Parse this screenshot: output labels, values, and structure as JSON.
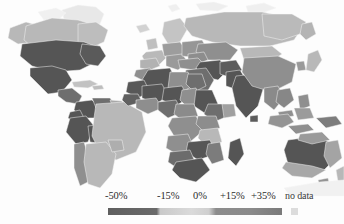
{
  "figure": {
    "type": "choropleth-world-map",
    "title": "",
    "background_color": "#fdfdfd"
  },
  "legend": {
    "orientation": "horizontal",
    "bar_start_x": 108,
    "bar_end_x": 282,
    "ticks": [
      {
        "label": "-50%",
        "x": 108,
        "value": -50
      },
      {
        "label": "-15%",
        "x": 159,
        "value": -15
      },
      {
        "label": "0%",
        "x": 194,
        "value": 0
      },
      {
        "label": "+15%",
        "x": 222,
        "value": 15
      },
      {
        "label": "+35%",
        "x": 253,
        "value": 35
      }
    ],
    "nodata": {
      "label": "no data",
      "x": 303,
      "swatch_color": "#dcdcdc"
    },
    "gradient_stops": [
      {
        "offset": "0%",
        "color": "#5f5f5f"
      },
      {
        "offset": "28%",
        "color": "#6a6a6a"
      },
      {
        "offset": "30%",
        "color": "#c9c9c9"
      },
      {
        "offset": "48%",
        "color": "#dadada"
      },
      {
        "offset": "58%",
        "color": "#cfcfcf"
      },
      {
        "offset": "62%",
        "color": "#8c8c8c"
      },
      {
        "offset": "82%",
        "color": "#8a8a8a"
      },
      {
        "offset": "100%",
        "color": "#7a7a7a"
      }
    ]
  },
  "chart_data": {
    "type": "heatmap",
    "title": "",
    "xlabel": "",
    "ylabel": "",
    "subtype": "world choropleth map",
    "colorbar_label": "",
    "colorbar_ticks": [
      "-50%",
      "-15%",
      "0%",
      "+15%",
      "+35%"
    ],
    "colorbar_range": [
      -50,
      35
    ],
    "nodata_label": "no data",
    "grid": false,
    "legend_position": "bottom",
    "palette": {
      "very_dark": "#555555",
      "dark": "#6e6e6e",
      "medium": "#8f8f8f",
      "light": "#b8b8b8",
      "very_light": "#d6d6d6",
      "no_data": "#e8e8e8",
      "ocean": "#fdfdfd",
      "border": "#f3f3f3"
    },
    "regions": [
      {
        "name": "Alaska",
        "shade": "light",
        "value": -10
      },
      {
        "name": "Canada",
        "shade": "light",
        "value": -10
      },
      {
        "name": "Greenland",
        "shade": "no_data",
        "value": null
      },
      {
        "name": "United States",
        "shade": "very_dark",
        "value": -45
      },
      {
        "name": "Mexico",
        "shade": "very_dark",
        "value": -45
      },
      {
        "name": "Central America",
        "shade": "dark",
        "value": -30
      },
      {
        "name": "Caribbean",
        "shade": "light",
        "value": -8
      },
      {
        "name": "Colombia",
        "shade": "very_dark",
        "value": -42
      },
      {
        "name": "Venezuela",
        "shade": "dark",
        "value": -28
      },
      {
        "name": "Peru",
        "shade": "very_dark",
        "value": -44
      },
      {
        "name": "Bolivia",
        "shade": "very_dark",
        "value": -44
      },
      {
        "name": "Brazil",
        "shade": "light",
        "value": -6
      },
      {
        "name": "Chile",
        "shade": "medium",
        "value": -18
      },
      {
        "name": "Argentina",
        "shade": "light",
        "value": -6
      },
      {
        "name": "Western Europe",
        "shade": "light",
        "value": -8
      },
      {
        "name": "Eastern Europe",
        "shade": "medium",
        "value": -16
      },
      {
        "name": "Russia",
        "shade": "light",
        "value": -5
      },
      {
        "name": "Kazakhstan",
        "shade": "medium",
        "value": -18
      },
      {
        "name": "Mongolia",
        "shade": "light",
        "value": -7
      },
      {
        "name": "China",
        "shade": "medium",
        "value": -20
      },
      {
        "name": "India",
        "shade": "very_dark",
        "value": -46
      },
      {
        "name": "Pakistan",
        "shade": "very_dark",
        "value": -45
      },
      {
        "name": "Iran",
        "shade": "very_dark",
        "value": -43
      },
      {
        "name": "Saudi Arabia",
        "shade": "dark",
        "value": -30
      },
      {
        "name": "Turkey",
        "shade": "medium",
        "value": -20
      },
      {
        "name": "Morocco",
        "shade": "medium",
        "value": -18
      },
      {
        "name": "Algeria",
        "shade": "very_dark",
        "value": -44
      },
      {
        "name": "Libya",
        "shade": "medium",
        "value": -17
      },
      {
        "name": "Egypt",
        "shade": "dark",
        "value": -30
      },
      {
        "name": "Mali",
        "shade": "very_dark",
        "value": -45
      },
      {
        "name": "Niger",
        "shade": "very_dark",
        "value": -45
      },
      {
        "name": "Nigeria",
        "shade": "dark",
        "value": -32
      },
      {
        "name": "Chad",
        "shade": "medium",
        "value": -18
      },
      {
        "name": "Sudan",
        "shade": "very_dark",
        "value": -44
      },
      {
        "name": "Ethiopia",
        "shade": "dark",
        "value": -30
      },
      {
        "name": "Kenya",
        "shade": "medium",
        "value": -18
      },
      {
        "name": "DR Congo",
        "shade": "medium",
        "value": -16
      },
      {
        "name": "Angola",
        "shade": "medium",
        "value": -17
      },
      {
        "name": "Tanzania",
        "shade": "light",
        "value": -8
      },
      {
        "name": "Zambia",
        "shade": "very_dark",
        "value": -44
      },
      {
        "name": "Madagascar",
        "shade": "very_dark",
        "value": -43
      },
      {
        "name": "South Africa",
        "shade": "very_dark",
        "value": -46
      },
      {
        "name": "Indonesia",
        "shade": "medium",
        "value": -18
      },
      {
        "name": "Southeast Asia",
        "shade": "medium",
        "value": -20
      },
      {
        "name": "Japan",
        "shade": "light",
        "value": -8
      },
      {
        "name": "Philippines",
        "shade": "medium",
        "value": -18
      },
      {
        "name": "Australia",
        "shade": "very_dark",
        "value": -45
      },
      {
        "name": "New Zealand",
        "shade": "light",
        "value": -8
      },
      {
        "name": "Antarctica",
        "shade": "no_data",
        "value": null
      }
    ]
  }
}
